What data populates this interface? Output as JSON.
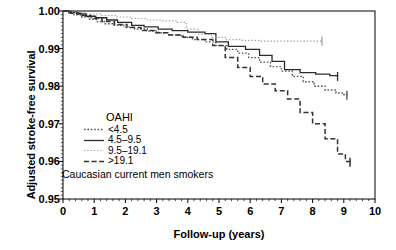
{
  "chart_data": {
    "type": "line",
    "title": "",
    "xlabel": "Follow-up (years)",
    "ylabel": "Adjusted stroke-free survival",
    "xlim": [
      0,
      10
    ],
    "ylim": [
      0.95,
      1.0
    ],
    "xticks": [
      "0",
      "1",
      "2",
      "3",
      "4",
      "5",
      "6",
      "7",
      "8",
      "9",
      "10"
    ],
    "xtick_values": [
      0,
      1,
      2,
      3,
      4,
      5,
      6,
      7,
      8,
      9,
      10
    ],
    "yticks": [
      "1.00",
      "0.99",
      "0.98",
      "0.97",
      "0.96",
      "0.95"
    ],
    "ytick_values": [
      1.0,
      0.99,
      0.98,
      0.97,
      0.96,
      0.95
    ],
    "grid": false,
    "minor_ticks": true,
    "legend_title": "OAHI",
    "legend_position": "inside-left-lower",
    "annotation": "Caucasian current men smokers",
    "curve_type": "kaplan-meier-step",
    "series": [
      {
        "name": "<4.5",
        "style": "fine-dotted",
        "color": "#555555",
        "points": [
          [
            0.0,
            1.0
          ],
          [
            0.15,
            0.9995
          ],
          [
            0.35,
            0.999
          ],
          [
            0.6,
            0.9984
          ],
          [
            0.85,
            0.9978
          ],
          [
            1.1,
            0.9972
          ],
          [
            1.35,
            0.9966
          ],
          [
            1.6,
            0.9962
          ],
          [
            1.95,
            0.9957
          ],
          [
            2.3,
            0.9952
          ],
          [
            2.7,
            0.9947
          ],
          [
            3.05,
            0.9942
          ],
          [
            3.4,
            0.9936
          ],
          [
            3.8,
            0.993
          ],
          [
            4.15,
            0.9924
          ],
          [
            4.55,
            0.9918
          ],
          [
            4.9,
            0.9908
          ],
          [
            5.25,
            0.9898
          ],
          [
            5.6,
            0.9888
          ],
          [
            5.95,
            0.9876
          ],
          [
            6.3,
            0.9864
          ],
          [
            6.65,
            0.9852
          ],
          [
            7.0,
            0.984
          ],
          [
            7.35,
            0.9826
          ],
          [
            7.7,
            0.9812
          ],
          [
            8.05,
            0.98
          ],
          [
            8.4,
            0.979
          ],
          [
            8.75,
            0.9782
          ],
          [
            9.0,
            0.9778
          ],
          [
            9.1,
            0.9776
          ]
        ],
        "censor_marks": [
          [
            9.1,
            0.9776
          ]
        ],
        "end_value": 0.9776
      },
      {
        "name": "4.5-9.5",
        "style": "solid",
        "color": "#2b2b2b",
        "points": [
          [
            0.0,
            1.0
          ],
          [
            0.2,
            0.9996
          ],
          [
            0.45,
            0.9992
          ],
          [
            0.75,
            0.9986
          ],
          [
            1.05,
            0.9982
          ],
          [
            1.4,
            0.9976
          ],
          [
            1.75,
            0.997
          ],
          [
            2.2,
            0.9962
          ],
          [
            2.6,
            0.9958
          ],
          [
            3.05,
            0.9952
          ],
          [
            3.5,
            0.9948
          ],
          [
            4.0,
            0.9944
          ],
          [
            4.55,
            0.994
          ],
          [
            4.9,
            0.9918
          ],
          [
            5.3,
            0.9906
          ],
          [
            5.85,
            0.9898
          ],
          [
            6.3,
            0.9882
          ],
          [
            6.7,
            0.9866
          ],
          [
            7.1,
            0.9844
          ],
          [
            7.6,
            0.9836
          ],
          [
            8.1,
            0.9832
          ],
          [
            8.55,
            0.9828
          ],
          [
            8.8,
            0.9826
          ]
        ],
        "censor_marks": [
          [
            8.8,
            0.9826
          ]
        ],
        "end_value": 0.9826
      },
      {
        "name": "9.5-19.1",
        "style": "dotted",
        "color": "#999999",
        "points": [
          [
            0.0,
            1.0
          ],
          [
            0.3,
            0.9996
          ],
          [
            0.7,
            0.9992
          ],
          [
            1.2,
            0.9988
          ],
          [
            1.7,
            0.9984
          ],
          [
            2.2,
            0.998
          ],
          [
            2.7,
            0.9976
          ],
          [
            3.2,
            0.9974
          ],
          [
            3.65,
            0.997
          ],
          [
            3.95,
            0.9952
          ],
          [
            4.35,
            0.9938
          ],
          [
            4.75,
            0.993
          ],
          [
            5.2,
            0.9924
          ],
          [
            5.7,
            0.9922
          ],
          [
            6.3,
            0.992
          ],
          [
            7.0,
            0.992
          ],
          [
            7.8,
            0.992
          ],
          [
            8.3,
            0.992
          ]
        ],
        "censor_marks": [
          [
            8.3,
            0.992
          ]
        ],
        "end_value": 0.992
      },
      {
        "name": ">19.1",
        "style": "dashed",
        "color": "#333333",
        "points": [
          [
            0.0,
            1.0
          ],
          [
            0.25,
            0.9994
          ],
          [
            0.55,
            0.9988
          ],
          [
            0.9,
            0.998
          ],
          [
            1.25,
            0.9972
          ],
          [
            1.65,
            0.9964
          ],
          [
            2.05,
            0.9956
          ],
          [
            2.5,
            0.9948
          ],
          [
            2.95,
            0.9942
          ],
          [
            3.4,
            0.9936
          ],
          [
            3.85,
            0.993
          ],
          [
            4.3,
            0.9924
          ],
          [
            4.8,
            0.9908
          ],
          [
            5.2,
            0.9876
          ],
          [
            5.6,
            0.985
          ],
          [
            6.0,
            0.9826
          ],
          [
            6.4,
            0.9806
          ],
          [
            6.8,
            0.9788
          ],
          [
            7.2,
            0.9766
          ],
          [
            7.6,
            0.973
          ],
          [
            8.0,
            0.97
          ],
          [
            8.4,
            0.966
          ],
          [
            8.8,
            0.962
          ],
          [
            9.05,
            0.96
          ],
          [
            9.2,
            0.9598
          ]
        ],
        "censor_marks": [
          [
            9.2,
            0.9598
          ]
        ],
        "end_value": 0.9598
      }
    ]
  },
  "legend": {
    "title": "OAHI",
    "entries": [
      {
        "label": "<4.5"
      },
      {
        "label": "4.5–9.5"
      },
      {
        "label": "9.5–19.1"
      },
      {
        "label": ">19.1"
      }
    ]
  },
  "axes": {
    "y_title": "Adjusted stroke-free survival",
    "x_title": "Follow-up (years)"
  },
  "annotation": {
    "text": "Caucasian current men smokers"
  }
}
